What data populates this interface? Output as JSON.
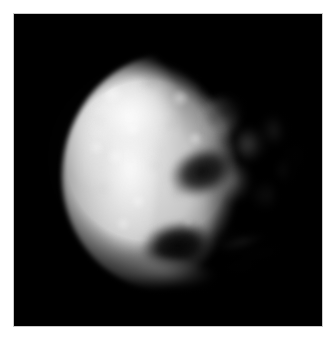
{
  "viewer": {
    "name": "image-viewer",
    "background_color": "#ffffff",
    "width": 336,
    "height": 342,
    "caption": ""
  },
  "image_plate": {
    "name": "comet-nucleus-photograph",
    "alt_text": "",
    "background_color": "#000000",
    "frame_color": "#c9c9c9",
    "left": 14,
    "top": 14,
    "width": 308,
    "height": 312
  },
  "subject": {
    "type": "grayscale-astronomical-image",
    "body": "comet nucleus",
    "description": "Irregular pear-shaped icy body, brightly lit from the upper left, heavily pitted surface, ragged dust-shedding right flank against black space",
    "illumination_direction": "upper-left",
    "palette": {
      "space": "#000000",
      "brightest_highlight": "#fafafa",
      "mid_surface": "#c6c6c6",
      "shadowed_surface": "#4a4a4a",
      "crater_floor": "#050505",
      "dust_wisp": "#8a8a8a"
    },
    "features": [
      {
        "name": "left-limb",
        "label": "smooth bright left limb",
        "tone": "bright"
      },
      {
        "name": "highlight-upper-left",
        "label": "upper-left specular highlight",
        "tone": "brightest"
      },
      {
        "name": "surface-texture",
        "label": "mottled cratered terrain",
        "tone": "mixed"
      },
      {
        "name": "crater-central",
        "label": "large dark elongated depression",
        "tone": "dark"
      },
      {
        "name": "crater-lower",
        "label": "prominent dark crater, lower centre",
        "tone": "darkest"
      },
      {
        "name": "crater-right-notch",
        "label": "secondary dark notch",
        "tone": "dark"
      },
      {
        "name": "shadow-upper-right",
        "label": "shadowed upper-right rim",
        "tone": "dark"
      },
      {
        "name": "ridge-lower",
        "label": "bright ridge along lower rim",
        "tone": "bright"
      },
      {
        "name": "right-flank",
        "label": "ragged fragmented right flank",
        "tone": "mid"
      },
      {
        "name": "dust-wisps",
        "label": "wispy dust filaments",
        "tone": "faint"
      },
      {
        "name": "coma-haze",
        "label": "faint surrounding coma haze",
        "tone": "faint"
      }
    ]
  }
}
